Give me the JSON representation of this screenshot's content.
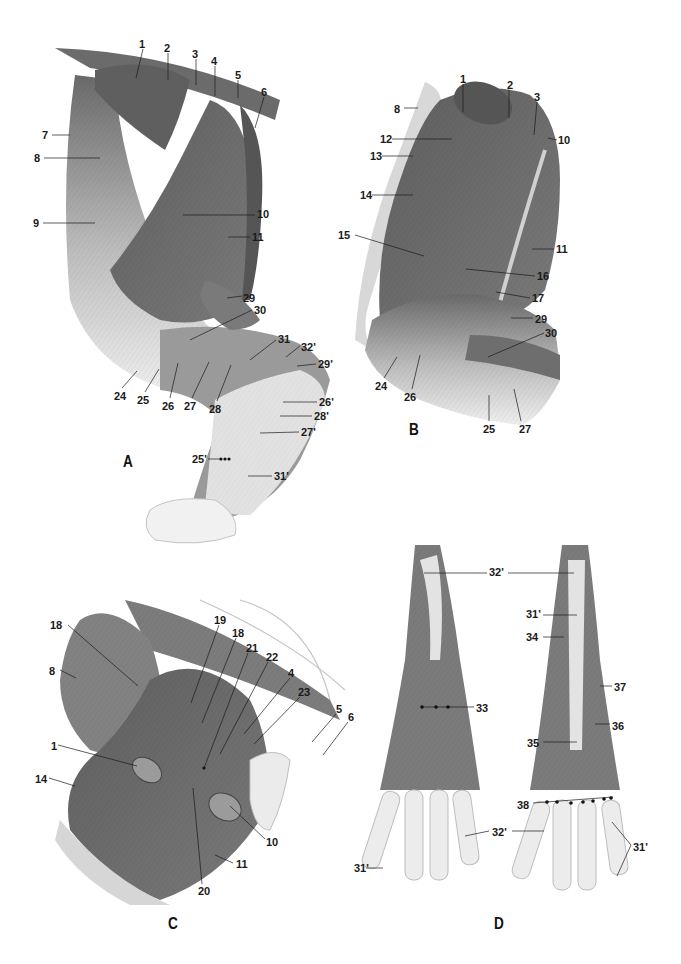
{
  "figure": {
    "colors": {
      "muscle": "#6f6f6f",
      "muscle_dark": "#555555",
      "tendon": "#d6d6d6",
      "skin": "#ececec",
      "label": "#1a1a1a",
      "background": "#ffffff"
    },
    "panels": [
      {
        "id": "A",
        "letter": "A",
        "labels": [
          {
            "text": "1",
            "x": 139,
            "y": 38
          },
          {
            "text": "2",
            "x": 164,
            "y": 42
          },
          {
            "text": "3",
            "x": 192,
            "y": 48
          },
          {
            "text": "4",
            "x": 211,
            "y": 55
          },
          {
            "text": "5",
            "x": 235,
            "y": 69
          },
          {
            "text": "6",
            "x": 261,
            "y": 86
          },
          {
            "text": "7",
            "x": 42,
            "y": 129
          },
          {
            "text": "8",
            "x": 34,
            "y": 152
          },
          {
            "text": "9",
            "x": 33,
            "y": 217
          },
          {
            "text": "10",
            "x": 257,
            "y": 208
          },
          {
            "text": "11",
            "x": 252,
            "y": 231
          },
          {
            "text": "29",
            "x": 243,
            "y": 292
          },
          {
            "text": "30",
            "x": 254,
            "y": 304
          },
          {
            "text": "31",
            "x": 278,
            "y": 333
          },
          {
            "text": "32'",
            "x": 301,
            "y": 341
          },
          {
            "text": "29'",
            "x": 318,
            "y": 358
          },
          {
            "text": "24",
            "x": 114,
            "y": 390
          },
          {
            "text": "25",
            "x": 137,
            "y": 394
          },
          {
            "text": "26",
            "x": 162,
            "y": 400
          },
          {
            "text": "27",
            "x": 184,
            "y": 400
          },
          {
            "text": "28",
            "x": 209,
            "y": 403
          },
          {
            "text": "26'",
            "x": 319,
            "y": 396
          },
          {
            "text": "28'",
            "x": 314,
            "y": 410
          },
          {
            "text": "27'",
            "x": 301,
            "y": 426
          },
          {
            "text": "25'",
            "x": 192,
            "y": 453
          },
          {
            "text": "31'",
            "x": 274,
            "y": 470
          }
        ]
      },
      {
        "id": "B",
        "letter": "B",
        "labels": [
          {
            "text": "1",
            "x": 460,
            "y": 73
          },
          {
            "text": "2",
            "x": 507,
            "y": 79
          },
          {
            "text": "3",
            "x": 534,
            "y": 91
          },
          {
            "text": "8",
            "x": 394,
            "y": 103
          },
          {
            "text": "10",
            "x": 558,
            "y": 134
          },
          {
            "text": "12",
            "x": 380,
            "y": 133
          },
          {
            "text": "13",
            "x": 370,
            "y": 150
          },
          {
            "text": "14",
            "x": 360,
            "y": 189
          },
          {
            "text": "15",
            "x": 338,
            "y": 229
          },
          {
            "text": "11",
            "x": 556,
            "y": 243
          },
          {
            "text": "16",
            "x": 537,
            "y": 270
          },
          {
            "text": "17",
            "x": 532,
            "y": 292
          },
          {
            "text": "29",
            "x": 535,
            "y": 313
          },
          {
            "text": "30",
            "x": 545,
            "y": 327
          },
          {
            "text": "24",
            "x": 375,
            "y": 380
          },
          {
            "text": "26",
            "x": 404,
            "y": 391
          },
          {
            "text": "25",
            "x": 483,
            "y": 423
          },
          {
            "text": "27",
            "x": 519,
            "y": 423
          }
        ]
      },
      {
        "id": "C",
        "letter": "C",
        "labels": [
          {
            "text": "19",
            "x": 214,
            "y": 614
          },
          {
            "text": "18",
            "x": 50,
            "y": 619
          },
          {
            "text": "18",
            "x": 232,
            "y": 627
          },
          {
            "text": "21",
            "x": 246,
            "y": 642
          },
          {
            "text": "22",
            "x": 266,
            "y": 651
          },
          {
            "text": "4",
            "x": 288,
            "y": 667
          },
          {
            "text": "23",
            "x": 298,
            "y": 686
          },
          {
            "text": "5",
            "x": 336,
            "y": 703
          },
          {
            "text": "6",
            "x": 348,
            "y": 711
          },
          {
            "text": "8",
            "x": 49,
            "y": 665
          },
          {
            "text": "1",
            "x": 51,
            "y": 740
          },
          {
            "text": "14",
            "x": 35,
            "y": 773
          },
          {
            "text": "10",
            "x": 266,
            "y": 836
          },
          {
            "text": "11",
            "x": 236,
            "y": 858
          },
          {
            "text": "20",
            "x": 198,
            "y": 885
          }
        ]
      },
      {
        "id": "D",
        "letter": "D",
        "labels": [
          {
            "text": "32'",
            "x": 489,
            "y": 566
          },
          {
            "text": "31'",
            "x": 526,
            "y": 608
          },
          {
            "text": "34",
            "x": 526,
            "y": 631
          },
          {
            "text": "37",
            "x": 614,
            "y": 681
          },
          {
            "text": "33",
            "x": 476,
            "y": 702
          },
          {
            "text": "36",
            "x": 612,
            "y": 720
          },
          {
            "text": "35",
            "x": 527,
            "y": 737
          },
          {
            "text": "38",
            "x": 517,
            "y": 799
          },
          {
            "text": "32'",
            "x": 492,
            "y": 826
          },
          {
            "text": "31'",
            "x": 633,
            "y": 841
          },
          {
            "text": "31'",
            "x": 354,
            "y": 862
          }
        ]
      }
    ],
    "letters_pos": {
      "A": {
        "x": 123,
        "y": 452
      },
      "B": {
        "x": 409,
        "y": 420
      },
      "C": {
        "x": 168,
        "y": 914
      },
      "D": {
        "x": 494,
        "y": 914
      }
    }
  }
}
